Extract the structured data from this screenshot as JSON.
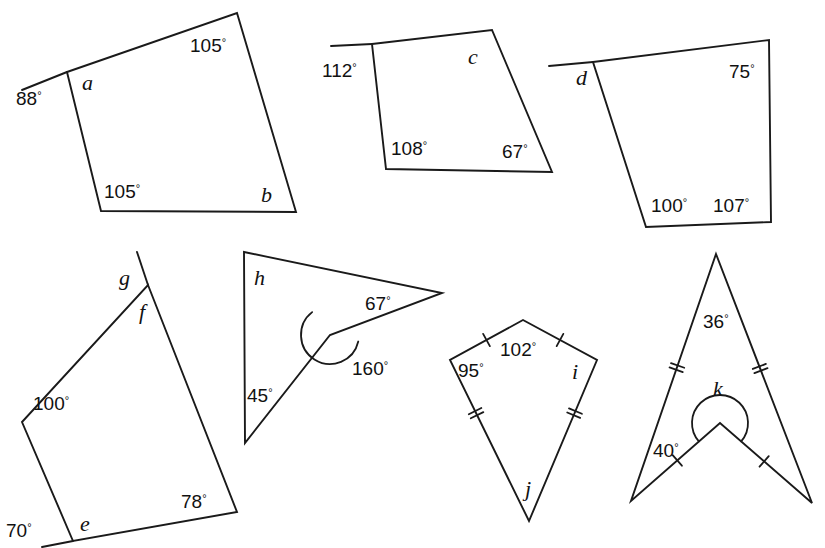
{
  "page": {
    "background_color": "#ffffff",
    "ink_color": "#1a1a1a",
    "width": 825,
    "height": 548
  },
  "figures": [
    {
      "id": "figure-1",
      "name": "quadrilateral-a-b",
      "kind": "quadrilateral",
      "vertices": [
        [
          67,
          72
        ],
        [
          237,
          13
        ],
        [
          296,
          212
        ],
        [
          101,
          211
        ]
      ],
      "tails": [
        [
          [
            67,
            72
          ],
          [
            22,
            90
          ]
        ]
      ],
      "labels": [
        {
          "name": "angle-88",
          "text": "88",
          "degree": true,
          "x": 16,
          "y": 105,
          "style": "value"
        },
        {
          "name": "angle-a",
          "text": "a",
          "degree": false,
          "x": 82,
          "y": 90,
          "style": "letter"
        },
        {
          "name": "angle-105-top",
          "text": "105",
          "degree": true,
          "x": 190,
          "y": 52,
          "style": "value"
        },
        {
          "name": "angle-105-bottom",
          "text": "105",
          "degree": true,
          "x": 104,
          "y": 198,
          "style": "value"
        },
        {
          "name": "angle-b",
          "text": "b",
          "degree": false,
          "x": 261,
          "y": 202,
          "style": "letter"
        }
      ],
      "arcs": [],
      "ticks": []
    },
    {
      "id": "figure-2",
      "name": "quadrilateral-c",
      "kind": "quadrilateral",
      "vertices": [
        [
          372,
          44
        ],
        [
          492,
          30
        ],
        [
          552,
          172
        ],
        [
          386,
          169
        ]
      ],
      "tails": [
        [
          [
            372,
            44
          ],
          [
            331,
            46
          ]
        ]
      ],
      "labels": [
        {
          "name": "angle-112",
          "text": "112",
          "degree": true,
          "x": 322,
          "y": 77,
          "style": "value"
        },
        {
          "name": "angle-c",
          "text": "c",
          "degree": false,
          "x": 468,
          "y": 64,
          "style": "letter"
        },
        {
          "name": "angle-108",
          "text": "108",
          "degree": true,
          "x": 391,
          "y": 155,
          "style": "value"
        },
        {
          "name": "angle-67",
          "text": "67",
          "degree": true,
          "x": 502,
          "y": 158,
          "style": "value"
        }
      ],
      "arcs": [],
      "ticks": []
    },
    {
      "id": "figure-3",
      "name": "quadrilateral-d",
      "kind": "quadrilateral",
      "vertices": [
        [
          593,
          62
        ],
        [
          769,
          40
        ],
        [
          771,
          222
        ],
        [
          646,
          227
        ]
      ],
      "tails": [
        [
          [
            593,
            62
          ],
          [
            549,
            66
          ]
        ]
      ],
      "labels": [
        {
          "name": "angle-d",
          "text": "d",
          "degree": false,
          "x": 576,
          "y": 85,
          "style": "letter"
        },
        {
          "name": "angle-75",
          "text": "75",
          "degree": true,
          "x": 729,
          "y": 78,
          "style": "value"
        },
        {
          "name": "angle-100",
          "text": "100",
          "degree": true,
          "x": 651,
          "y": 212,
          "style": "value"
        },
        {
          "name": "angle-107",
          "text": "107",
          "degree": true,
          "x": 713,
          "y": 212,
          "style": "value"
        }
      ],
      "arcs": [],
      "ticks": []
    },
    {
      "id": "figure-4",
      "name": "quadrilateral-e-f-g",
      "kind": "quadrilateral",
      "vertices": [
        [
          148,
          285
        ],
        [
          237,
          512
        ],
        [
          73,
          541
        ],
        [
          22,
          422
        ]
      ],
      "tails": [
        [
          [
            148,
            285
          ],
          [
            137,
            252
          ]
        ],
        [
          [
            73,
            541
          ],
          [
            42,
            547
          ]
        ]
      ],
      "labels": [
        {
          "name": "angle-g",
          "text": "g",
          "degree": false,
          "x": 119,
          "y": 285,
          "style": "letter"
        },
        {
          "name": "angle-f",
          "text": "f",
          "degree": false,
          "x": 139,
          "y": 319,
          "style": "letter"
        },
        {
          "name": "angle-100",
          "text": "100",
          "degree": true,
          "x": 33,
          "y": 410,
          "style": "value"
        },
        {
          "name": "angle-70",
          "text": "70",
          "degree": true,
          "x": 6,
          "y": 537,
          "style": "value"
        },
        {
          "name": "angle-e",
          "text": "e",
          "degree": false,
          "x": 80,
          "y": 531,
          "style": "letter"
        },
        {
          "name": "angle-78",
          "text": "78",
          "degree": true,
          "x": 181,
          "y": 508,
          "style": "value"
        }
      ],
      "arcs": [],
      "ticks": []
    },
    {
      "id": "figure-5",
      "name": "concave-quadrilateral-h",
      "kind": "concave-quadrilateral",
      "vertices": [
        [
          244,
          252
        ],
        [
          442,
          293
        ],
        [
          330,
          335
        ],
        [
          245,
          443
        ]
      ],
      "tails": [],
      "labels": [
        {
          "name": "angle-h",
          "text": "h",
          "degree": false,
          "x": 254,
          "y": 285,
          "style": "letter"
        },
        {
          "name": "angle-67",
          "text": "67",
          "degree": true,
          "x": 365,
          "y": 310,
          "style": "value"
        },
        {
          "name": "angle-160",
          "text": "160",
          "degree": true,
          "x": 352,
          "y": 375,
          "style": "value"
        },
        {
          "name": "angle-45",
          "text": "45",
          "degree": true,
          "x": 247,
          "y": 402,
          "style": "value"
        }
      ],
      "arcs": [
        {
          "name": "reflex-arc-160",
          "cx": 330,
          "cy": 335,
          "r": 29,
          "start_deg": 13,
          "end_deg": 232,
          "sweep": 1
        }
      ],
      "ticks": []
    },
    {
      "id": "figure-6",
      "name": "kite-i-j",
      "kind": "kite",
      "vertices": [
        [
          523,
          320
        ],
        [
          597,
          360
        ],
        [
          529,
          521
        ],
        [
          450,
          360
        ]
      ],
      "tails": [],
      "labels": [
        {
          "name": "angle-102",
          "text": "102",
          "degree": true,
          "x": 500,
          "y": 356,
          "style": "value"
        },
        {
          "name": "angle-95",
          "text": "95",
          "degree": true,
          "x": 458,
          "y": 377,
          "style": "value"
        },
        {
          "name": "angle-i",
          "text": "i",
          "degree": false,
          "x": 572,
          "y": 379,
          "style": "letter"
        },
        {
          "name": "angle-j",
          "text": "j",
          "degree": false,
          "x": 525,
          "y": 496,
          "style": "letter"
        }
      ],
      "arcs": [],
      "ticks": [
        {
          "name": "tick-single-upper-left",
          "x1": 523,
          "y1": 320,
          "x2": 450,
          "y2": 360,
          "count": 1,
          "t": 0.5
        },
        {
          "name": "tick-single-upper-right",
          "x1": 523,
          "y1": 320,
          "x2": 597,
          "y2": 360,
          "count": 1,
          "t": 0.5
        },
        {
          "name": "tick-double-lower-left",
          "x1": 450,
          "y1": 360,
          "x2": 529,
          "y2": 521,
          "count": 2,
          "t": 0.33
        },
        {
          "name": "tick-double-lower-right",
          "x1": 597,
          "y1": 360,
          "x2": 529,
          "y2": 521,
          "count": 2,
          "t": 0.33
        }
      ]
    },
    {
      "id": "figure-7",
      "name": "dart-k",
      "kind": "dart",
      "vertices": [
        [
          716,
          254
        ],
        [
          812,
          503
        ],
        [
          720,
          423
        ],
        [
          631,
          501
        ]
      ],
      "tails": [],
      "labels": [
        {
          "name": "angle-36",
          "text": "36",
          "degree": true,
          "x": 703,
          "y": 328,
          "style": "value"
        },
        {
          "name": "angle-k",
          "text": "k",
          "degree": false,
          "x": 713,
          "y": 396,
          "style": "letter"
        },
        {
          "name": "angle-40",
          "text": "40",
          "degree": true,
          "x": 653,
          "y": 457,
          "style": "value"
        }
      ],
      "arcs": [
        {
          "name": "reflex-arc-k",
          "cx": 720,
          "cy": 423,
          "r": 28,
          "start_deg": 139,
          "end_deg": 41,
          "sweep": 1
        }
      ],
      "ticks": [
        {
          "name": "tick-double-upper-left",
          "x1": 716,
          "y1": 254,
          "x2": 631,
          "y2": 501,
          "count": 2,
          "t": 0.46
        },
        {
          "name": "tick-double-upper-right",
          "x1": 716,
          "y1": 254,
          "x2": 812,
          "y2": 503,
          "count": 2,
          "t": 0.46
        },
        {
          "name": "tick-single-lower-left",
          "x1": 631,
          "y1": 501,
          "x2": 720,
          "y2": 423,
          "count": 1,
          "t": 0.52
        },
        {
          "name": "tick-single-lower-right",
          "x1": 812,
          "y1": 503,
          "x2": 720,
          "y2": 423,
          "count": 1,
          "t": 0.52
        }
      ]
    }
  ]
}
